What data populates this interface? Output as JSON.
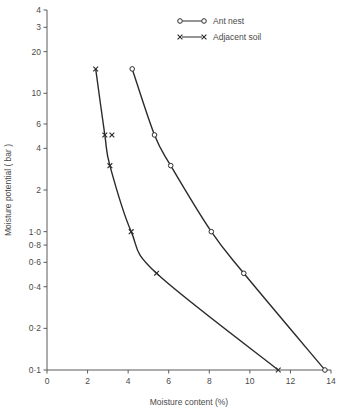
{
  "chart_data": {
    "type": "line",
    "title": "",
    "xlabel": "Moisture content (%)",
    "ylabel": "Moisture potential ( bar )",
    "xlim": [
      0,
      14
    ],
    "ylim": [
      0.1,
      40
    ],
    "yscale": "log",
    "grid": false,
    "legend_position": "top-center",
    "x_ticks": [
      0,
      2,
      4,
      6,
      8,
      10,
      12,
      14
    ],
    "x_tick_labels": [
      "0",
      "2",
      "4",
      "6",
      "8",
      "10",
      "12",
      "14"
    ],
    "y_ticks": [
      40,
      30,
      20,
      10,
      6,
      4,
      2,
      1.0,
      0.8,
      0.6,
      0.4,
      0.2,
      0.1
    ],
    "y_tick_labels": [
      "4",
      "3",
      "20",
      "10",
      "6",
      "4",
      "2",
      "1·0",
      "0·8",
      "0·6",
      "0·4",
      "0·2",
      "0·1"
    ],
    "series": [
      {
        "name": "Ant nest",
        "marker": "circle",
        "points": [
          {
            "x": 4.2,
            "y": 15.0
          },
          {
            "x": 5.3,
            "y": 5.0
          },
          {
            "x": 6.1,
            "y": 3.0
          },
          {
            "x": 8.1,
            "y": 1.0
          },
          {
            "x": 9.7,
            "y": 0.5
          },
          {
            "x": 13.7,
            "y": 0.1
          }
        ]
      },
      {
        "name": "Adjacent soil",
        "marker": "x",
        "points": [
          {
            "x": 2.4,
            "y": 15.0
          },
          {
            "x": 2.85,
            "y": 5.0
          },
          {
            "x": 3.2,
            "y": 5.0
          },
          {
            "x": 3.1,
            "y": 3.0
          },
          {
            "x": 4.15,
            "y": 1.0
          },
          {
            "x": 5.4,
            "y": 0.5
          },
          {
            "x": 11.4,
            "y": 0.1
          }
        ]
      }
    ]
  },
  "axes": {
    "x_title": "Moisture content (%)",
    "y_title": "Moisture potential ( bar )"
  },
  "legend": {
    "entries": [
      {
        "label": "Ant nest",
        "marker": "circle"
      },
      {
        "label": "Adjacent soil",
        "marker": "x"
      }
    ]
  },
  "colors": {
    "ink": "#2b2b2b",
    "axis": "#5a5a5a",
    "text": "#4a4a4a",
    "background": "#ffffff"
  }
}
